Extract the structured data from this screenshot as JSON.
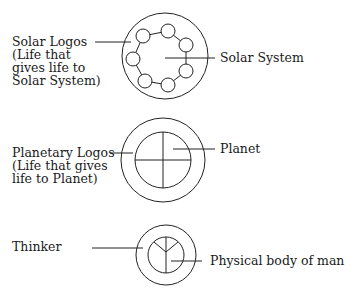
{
  "diagram": {
    "colors": {
      "line": "#222222",
      "text": "#1a1a1a",
      "background": "#ffffff"
    },
    "solar": {
      "left_label": [
        "Solar Logos",
        "(Life that",
        "gives life to",
        "Solar System)"
      ],
      "right_label": "Solar System",
      "small_circle_count": 7
    },
    "planetary": {
      "left_label": [
        "Planetary Logos",
        "(Life that gives",
        "life to Planet)"
      ],
      "right_label": "Planet"
    },
    "human": {
      "left_label": "Thinker",
      "right_label": "Physical body of man"
    }
  }
}
